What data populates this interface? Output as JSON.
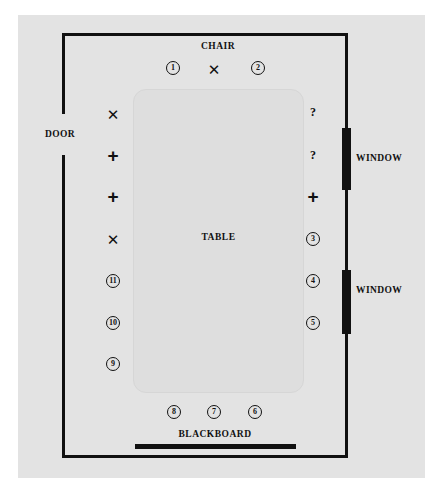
{
  "diagram": {
    "background_color": "#e3e3e3",
    "ink_color": "#111111",
    "table_color": "#dedede"
  },
  "labels": {
    "chair": "CHAIR",
    "table": "TABLE",
    "door": "DOOR",
    "blackboard": "BLACKBOARD",
    "window_upper": "WINDOW",
    "window_lower": "WINDOW"
  },
  "markers": {
    "top_row": [
      {
        "id": "seat-1",
        "kind": "circle",
        "text": "1",
        "x": 173,
        "y": 68
      },
      {
        "id": "chair-position",
        "kind": "x",
        "text": "✕",
        "x": 214,
        "y": 69
      },
      {
        "id": "seat-2",
        "kind": "circle",
        "text": "2",
        "x": 258,
        "y": 68
      }
    ],
    "left_column": [
      {
        "id": "left-x-1",
        "kind": "x",
        "text": "✕",
        "x": 113,
        "y": 114
      },
      {
        "id": "left-plus-1",
        "kind": "plus",
        "text": "+",
        "x": 113,
        "y": 155
      },
      {
        "id": "left-plus-2",
        "kind": "plus",
        "text": "+",
        "x": 113,
        "y": 196
      },
      {
        "id": "left-x-2",
        "kind": "x",
        "text": "✕",
        "x": 113,
        "y": 239
      },
      {
        "id": "seat-11",
        "kind": "circle",
        "text": "11",
        "x": 113,
        "y": 281
      },
      {
        "id": "seat-10",
        "kind": "circle",
        "text": "10",
        "x": 113,
        "y": 323
      },
      {
        "id": "seat-9",
        "kind": "circle",
        "text": "9",
        "x": 113,
        "y": 364
      }
    ],
    "right_column": [
      {
        "id": "right-question-1",
        "kind": "question",
        "text": "?",
        "x": 313,
        "y": 112
      },
      {
        "id": "right-question-2",
        "kind": "question",
        "text": "?",
        "x": 313,
        "y": 155
      },
      {
        "id": "right-plus-1",
        "kind": "plus",
        "text": "+",
        "x": 313,
        "y": 196
      },
      {
        "id": "seat-3",
        "kind": "circle",
        "text": "3",
        "x": 313,
        "y": 239
      },
      {
        "id": "seat-4",
        "kind": "circle",
        "text": "4",
        "x": 313,
        "y": 281
      },
      {
        "id": "seat-5",
        "kind": "circle",
        "text": "5",
        "x": 313,
        "y": 323
      }
    ],
    "bottom_row": [
      {
        "id": "seat-8",
        "kind": "circle",
        "text": "8",
        "x": 174,
        "y": 412
      },
      {
        "id": "seat-7",
        "kind": "circle",
        "text": "7",
        "x": 214,
        "y": 412
      },
      {
        "id": "seat-6",
        "kind": "circle",
        "text": "6",
        "x": 255,
        "y": 412
      }
    ]
  }
}
